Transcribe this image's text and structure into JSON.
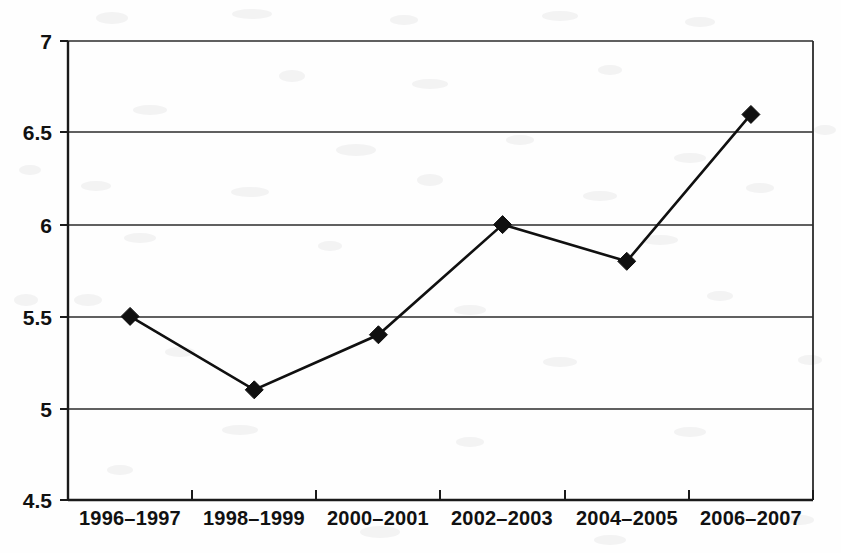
{
  "chart_data": {
    "type": "line",
    "title": "",
    "subtitle": "",
    "xlabel": "",
    "ylabel": "",
    "categories": [
      "1996–1997",
      "1998–1999",
      "2000–2001",
      "2002–2003",
      "2004–2005",
      "2006–2007"
    ],
    "values": [
      5.5,
      5.1,
      5.4,
      6.0,
      5.8,
      6.6
    ],
    "series": [
      {
        "name": "",
        "values": [
          5.5,
          5.1,
          5.4,
          6.0,
          5.8,
          6.6
        ]
      }
    ],
    "ylim": [
      4.5,
      7
    ],
    "ytick_labels": [
      "7",
      "6.5",
      "6",
      "5.5",
      "5",
      "4.5"
    ],
    "ytick_values": [
      7,
      6.5,
      6,
      5.5,
      5,
      4.5
    ],
    "ystep": 0.5,
    "grid": "horizontal",
    "legend": "none",
    "marker": "diamond",
    "line_color": "#101010",
    "marker_color": "#101010",
    "gridline_color": "#2b2b2b",
    "background_color": "#fefefe",
    "annotations": []
  },
  "plot": {
    "left": 68,
    "right": 813,
    "top": 41,
    "bottom": 500
  }
}
